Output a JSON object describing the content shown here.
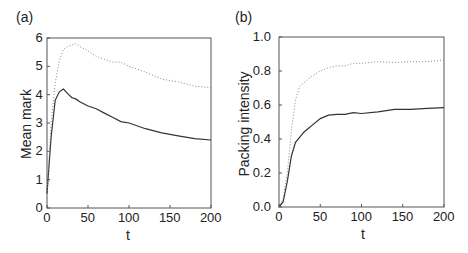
{
  "chart_data": [
    {
      "type": "line",
      "panel_label": "(a)",
      "title": "",
      "xlabel": "t",
      "ylabel": "Mean mark",
      "xlim": [
        0,
        200
      ],
      "ylim": [
        0,
        6
      ],
      "xticks": [
        "0",
        "50",
        "100",
        "150",
        "200"
      ],
      "yticks": [
        "0",
        "1",
        "2",
        "3",
        "4",
        "5",
        "6"
      ],
      "grid": false,
      "legend": null,
      "x": [
        0,
        5,
        10,
        15,
        20,
        25,
        30,
        35,
        40,
        50,
        60,
        70,
        80,
        90,
        100,
        120,
        140,
        160,
        180,
        200
      ],
      "series": [
        {
          "name": "solid",
          "style": "solid",
          "values": [
            0.5,
            2.5,
            3.8,
            4.1,
            4.2,
            4.05,
            3.9,
            3.85,
            3.75,
            3.6,
            3.5,
            3.35,
            3.2,
            3.05,
            3.0,
            2.8,
            2.65,
            2.55,
            2.45,
            2.4
          ]
        },
        {
          "name": "dotted",
          "style": "dotted",
          "values": [
            0.5,
            3.0,
            4.4,
            5.2,
            5.6,
            5.7,
            5.75,
            5.8,
            5.7,
            5.55,
            5.35,
            5.25,
            5.15,
            5.15,
            5.0,
            4.8,
            4.55,
            4.45,
            4.3,
            4.25
          ]
        }
      ]
    },
    {
      "type": "line",
      "panel_label": "(b)",
      "title": "",
      "xlabel": "t",
      "ylabel": "Packing intensity",
      "xlim": [
        0,
        200
      ],
      "ylim": [
        0,
        1.0
      ],
      "xticks": [
        "0",
        "50",
        "100",
        "150",
        "200"
      ],
      "yticks": [
        "0.0",
        "0.2",
        "0.4",
        "0.6",
        "0.8",
        "1.0"
      ],
      "grid": false,
      "legend": null,
      "x": [
        0,
        5,
        10,
        15,
        20,
        25,
        30,
        35,
        40,
        50,
        60,
        70,
        80,
        90,
        100,
        120,
        140,
        160,
        180,
        200
      ],
      "series": [
        {
          "name": "solid",
          "style": "solid",
          "values": [
            0.0,
            0.03,
            0.15,
            0.3,
            0.38,
            0.41,
            0.44,
            0.46,
            0.48,
            0.52,
            0.54,
            0.545,
            0.545,
            0.555,
            0.55,
            0.56,
            0.575,
            0.575,
            0.58,
            0.585
          ]
        },
        {
          "name": "dotted",
          "style": "dotted",
          "values": [
            0.0,
            0.05,
            0.2,
            0.45,
            0.63,
            0.71,
            0.73,
            0.75,
            0.77,
            0.8,
            0.82,
            0.83,
            0.83,
            0.845,
            0.845,
            0.855,
            0.85,
            0.855,
            0.855,
            0.865
          ]
        }
      ]
    }
  ],
  "colors": {
    "axis": "#555555",
    "solid_line": "#333333",
    "dotted_line": "#888888",
    "text": "#222222"
  }
}
